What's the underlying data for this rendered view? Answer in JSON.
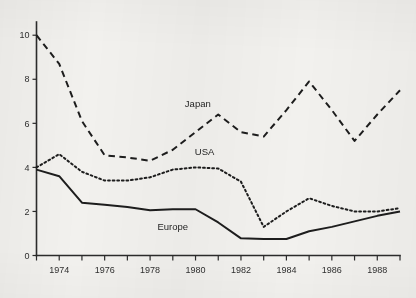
{
  "figure": {
    "background_color": "#f2f1ee",
    "ink_color": "#1d1d1d",
    "width": 416,
    "height": 298
  },
  "chart_data": {
    "type": "line",
    "title": "",
    "subtitle": "",
    "xlabel": "",
    "ylabel": "",
    "xlim": [
      1973,
      1989
    ],
    "ylim": [
      0,
      10.6
    ],
    "grid": false,
    "legend_position": "inline-annotations",
    "x": [
      1973,
      1974,
      1975,
      1976,
      1977,
      1978,
      1979,
      1980,
      1981,
      1982,
      1983,
      1984,
      1985,
      1986,
      1987,
      1988,
      1989
    ],
    "x_tick_values": [
      1973,
      1974,
      1975,
      1976,
      1977,
      1978,
      1979,
      1980,
      1981,
      1982,
      1983,
      1984,
      1985,
      1986,
      1987,
      1988,
      1989
    ],
    "x_tick_labels": [
      "",
      "1974",
      "",
      "1976",
      "",
      "1978",
      "",
      "1980",
      "",
      "1982",
      "",
      "1984",
      "",
      "1986",
      "",
      "1988",
      ""
    ],
    "y_tick_values": [
      0,
      2,
      4,
      6,
      8,
      10
    ],
    "y_tick_labels": [
      "0",
      "2",
      "4",
      "6",
      "8",
      "10"
    ],
    "series": [
      {
        "name": "Japan",
        "style": "dashed",
        "label_x": 1980.1,
        "label_y": 6.75,
        "values": [
          10.0,
          8.7,
          6.1,
          4.55,
          4.45,
          4.3,
          4.8,
          5.6,
          6.4,
          5.6,
          5.4,
          6.6,
          7.9,
          6.6,
          5.2,
          6.4,
          7.5
        ]
      },
      {
        "name": "USA",
        "style": "dotted",
        "label_x": 1980.4,
        "label_y": 4.55,
        "values": [
          4.0,
          4.6,
          3.8,
          3.4,
          3.4,
          3.55,
          3.9,
          4.0,
          3.95,
          3.35,
          1.3,
          2.0,
          2.6,
          2.25,
          2.0,
          2.0,
          2.15
        ]
      },
      {
        "name": "Europe",
        "style": "solid",
        "label_x": 1979.0,
        "label_y": 1.15,
        "values": [
          3.9,
          3.6,
          2.4,
          2.3,
          2.2,
          2.05,
          2.1,
          2.1,
          1.5,
          0.78,
          0.75,
          0.75,
          1.1,
          1.3,
          1.55,
          1.8,
          2.0
        ]
      }
    ]
  }
}
